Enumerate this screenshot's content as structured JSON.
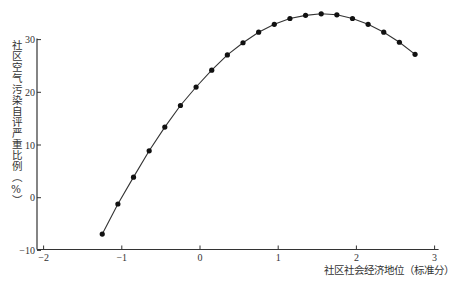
{
  "chart_data": {
    "type": "line",
    "title": "",
    "xlabel": "社区社会经济地位（标准分）",
    "ylabel": "社区空气污染自评严重比例（%）",
    "xlim": [
      -2,
      3
    ],
    "ylim": [
      -10,
      30
    ],
    "xticks": [
      -2,
      -1,
      0,
      1,
      2,
      3
    ],
    "yticks": [
      -10,
      0,
      10,
      20,
      30
    ],
    "grid": false,
    "legend": null,
    "markers": true,
    "x": [
      -1.25,
      -1.05,
      -0.85,
      -0.65,
      -0.45,
      -0.25,
      -0.05,
      0.15,
      0.35,
      0.55,
      0.75,
      0.95,
      1.15,
      1.35,
      1.55,
      1.75,
      1.95,
      2.15,
      2.35,
      2.55,
      2.75
    ],
    "values": [
      -6.9,
      -1.2,
      3.9,
      8.9,
      13.4,
      17.5,
      21.0,
      24.2,
      27.1,
      29.4,
      31.4,
      32.9,
      34.0,
      34.6,
      34.9,
      34.7,
      34.0,
      32.9,
      31.4,
      29.5,
      27.2
    ]
  },
  "axes": {
    "xlabel": "社区社会经济地位（标准分）",
    "ylabel": "社区空气污染自评严重比例（%）"
  },
  "colors": {
    "line": "#333333",
    "marker": "#111111",
    "axis": "#333333"
  }
}
